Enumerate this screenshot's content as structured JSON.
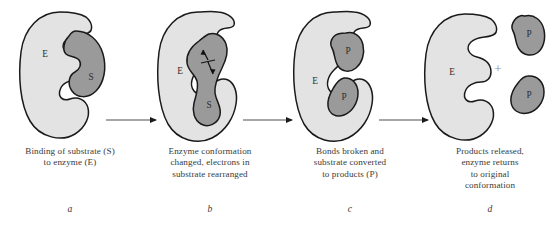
{
  "figure": {
    "colors": {
      "background": "#ffffff",
      "enzyme_fill": "#e3e3e3",
      "substrate_fill": "#9a9a9a",
      "outline": "#1a1a1a",
      "arrow_line": "#8a8a8a",
      "arrow_head": "#1a1a1a",
      "caption_text": "#3a3a3a",
      "plus_sign": "#8d8d8d"
    }
  },
  "panels": [
    {
      "id": "a",
      "panel_label": "a",
      "caption_lines": [
        "Binding of substrate (S)",
        "to enzyme (E)"
      ],
      "shape_labels": {
        "enzyme": "E",
        "substrate": "S"
      }
    },
    {
      "id": "b",
      "panel_label": "b",
      "caption_lines": [
        "Enzyme conformation",
        "changed, electrons in",
        "substrate rearranged"
      ],
      "shape_labels": {
        "enzyme": "E",
        "substrate": "S"
      }
    },
    {
      "id": "c",
      "panel_label": "c",
      "caption_lines": [
        "Bonds broken and",
        "substrate converted",
        "to products (P)"
      ],
      "shape_labels": {
        "enzyme": "E",
        "product_top": "P",
        "product_bottom": "P"
      }
    },
    {
      "id": "d",
      "panel_label": "d",
      "caption_lines": [
        "Products released,",
        "enzyme returns",
        "to original",
        "conformation"
      ],
      "shape_labels": {
        "enzyme": "E",
        "product_top": "P",
        "product_bottom": "P",
        "plus": "+"
      }
    }
  ],
  "arrows": [
    {
      "id": "arrow-a-b",
      "from": "a",
      "to": "b"
    },
    {
      "id": "arrow-b-c",
      "from": "b",
      "to": "c"
    },
    {
      "id": "arrow-c-d",
      "from": "c",
      "to": "d"
    }
  ]
}
